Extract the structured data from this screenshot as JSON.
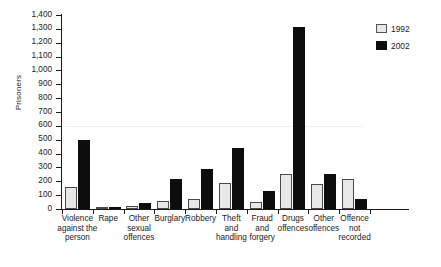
{
  "chart_data": {
    "type": "bar",
    "title": "",
    "xlabel": "",
    "ylabel": "Prisoners",
    "ylim": [
      0,
      1400
    ],
    "ytick_step": 100,
    "grid": false,
    "legend_position": "top-right",
    "categories": [
      "Violence against the person",
      "Rape",
      "Other sexual offences",
      "Burglary",
      "Robbery",
      "Theft and handling",
      "Fraud and forgery",
      "Drugs offences",
      "Other offences",
      "Offence not recorded"
    ],
    "category_lines": [
      [
        "Violence",
        "against the",
        "person"
      ],
      [
        "Rape"
      ],
      [
        "Other",
        "sexual",
        "offences"
      ],
      [
        "Burglary"
      ],
      [
        "Robbery"
      ],
      [
        "Theft",
        "and",
        "handling"
      ],
      [
        "Fraud",
        "and",
        "forgery"
      ],
      [
        "Drugs",
        "offences"
      ],
      [
        "Other",
        "offences"
      ],
      [
        "Offence",
        "not",
        "recorded"
      ]
    ],
    "ytick_labels": [
      "0",
      "100",
      "200",
      "300",
      "400",
      "500",
      "600",
      "700",
      "800",
      "900",
      "1,000",
      "1,100",
      "1,200",
      "1,300",
      "1,400"
    ],
    "ytick_values": [
      0,
      100,
      200,
      300,
      400,
      500,
      600,
      700,
      800,
      900,
      1000,
      1100,
      1200,
      1300,
      1400
    ],
    "series": [
      {
        "name": "1992",
        "color": "#e8e8e6",
        "values": [
          160,
          10,
          25,
          60,
          75,
          190,
          50,
          250,
          180,
          220
        ]
      },
      {
        "name": "2002",
        "color": "#0d0d0d",
        "values": [
          500,
          15,
          45,
          220,
          290,
          440,
          130,
          1310,
          250,
          70
        ]
      }
    ]
  },
  "legend": {
    "items": [
      {
        "label": "1992",
        "swatch": "y1992"
      },
      {
        "label": "2002",
        "swatch": "y2002"
      }
    ]
  }
}
